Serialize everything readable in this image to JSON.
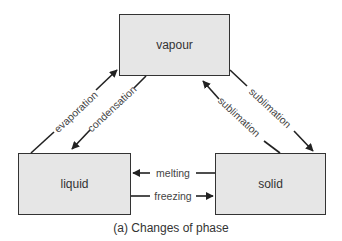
{
  "diagram": {
    "nodes": {
      "vapour": "vapour",
      "liquid": "liquid",
      "solid": "solid"
    },
    "edges": {
      "evaporation": "evaporation",
      "condensation": "condensation",
      "sublimation_up": "sublimation",
      "sublimation_down": "sublimation",
      "melting": "melting",
      "freezing": "freezing"
    },
    "caption": "(a) Changes of phase",
    "colors": {
      "box_fill": "#e6e6e6",
      "stroke": "#333333"
    }
  }
}
